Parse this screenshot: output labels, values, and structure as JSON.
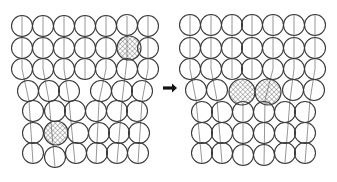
{
  "figure": {
    "colors": {
      "stroke": "#3a3a3a",
      "plane_line": "#8a8a8a",
      "hatch": "#555555",
      "background": "#ffffff"
    },
    "panels": [
      {
        "name": "before",
        "atom_radius": 10.5,
        "atoms": [
          [
            22,
            26
          ],
          [
            43,
            26
          ],
          [
            64,
            26
          ],
          [
            85,
            26
          ],
          [
            106,
            26
          ],
          [
            127,
            25
          ],
          [
            148,
            26
          ],
          [
            22,
            48
          ],
          [
            43,
            48
          ],
          [
            64,
            48
          ],
          [
            85,
            48
          ],
          [
            106,
            48
          ],
          [
            148,
            48
          ],
          [
            22,
            69
          ],
          [
            43,
            69
          ],
          [
            64,
            69
          ],
          [
            85,
            69
          ],
          [
            106,
            69
          ],
          [
            127,
            69
          ],
          [
            148,
            69
          ],
          [
            28,
            91
          ],
          [
            49,
            91
          ],
          [
            69,
            91
          ],
          [
            101,
            91
          ],
          [
            122,
            91
          ],
          [
            142,
            91
          ],
          [
            33,
            111
          ],
          [
            55,
            111
          ],
          [
            75,
            111
          ],
          [
            96,
            111
          ],
          [
            117,
            111
          ],
          [
            137,
            111
          ],
          [
            33,
            133
          ],
          [
            78,
            133
          ],
          [
            99,
            133
          ],
          [
            119,
            133
          ],
          [
            139,
            133
          ],
          [
            33,
            153
          ],
          [
            55,
            157
          ],
          [
            76,
            153
          ],
          [
            97,
            153
          ],
          [
            117,
            153
          ],
          [
            138,
            153
          ]
        ],
        "hatched_atoms": [
          [
            129,
            48,
            12
          ],
          [
            56,
            133,
            12
          ]
        ],
        "plane_lines": [
          [
            [
              22,
              16
            ],
            [
              22,
              69
            ],
            [
              29,
              101
            ],
            [
              33,
              163
            ]
          ],
          [
            [
              43,
              16
            ],
            [
              43,
              69
            ],
            [
              49,
              101
            ],
            [
              55,
              167
            ]
          ],
          [
            [
              64,
              16
            ],
            [
              64,
              69
            ],
            [
              69,
              101
            ],
            [
              75,
              163
            ]
          ],
          [
            [
              85,
              16
            ],
            [
              85,
              79
            ]
          ],
          [
            [
              106,
              16
            ],
            [
              106,
              69
            ],
            [
              99,
              101
            ],
            [
              96,
              163
            ]
          ],
          [
            [
              127,
              16
            ],
            [
              127,
              60
            ],
            [
              122,
              101
            ],
            [
              117,
              163
            ]
          ],
          [
            [
              148,
              16
            ],
            [
              148,
              69
            ],
            [
              142,
              101
            ],
            [
              138,
              163
            ]
          ]
        ]
      },
      {
        "name": "after",
        "atom_radius": 10.5,
        "atoms": [
          [
            190,
            25
          ],
          [
            211,
            25
          ],
          [
            232,
            25
          ],
          [
            252,
            25
          ],
          [
            273,
            25
          ],
          [
            294,
            25
          ],
          [
            315,
            25
          ],
          [
            190,
            48
          ],
          [
            211,
            48
          ],
          [
            232,
            48
          ],
          [
            252,
            48
          ],
          [
            273,
            48
          ],
          [
            294,
            48
          ],
          [
            315,
            48
          ],
          [
            190,
            69
          ],
          [
            211,
            69
          ],
          [
            232,
            69
          ],
          [
            252,
            69
          ],
          [
            273,
            69
          ],
          [
            294,
            69
          ],
          [
            315,
            69
          ],
          [
            196,
            90
          ],
          [
            217,
            90
          ],
          [
            293,
            90
          ],
          [
            314,
            90
          ],
          [
            202,
            112
          ],
          [
            222,
            112
          ],
          [
            243,
            112
          ],
          [
            264,
            112
          ],
          [
            285,
            112
          ],
          [
            305,
            112
          ],
          [
            202,
            133
          ],
          [
            222,
            133
          ],
          [
            243,
            133
          ],
          [
            264,
            133
          ],
          [
            285,
            133
          ],
          [
            305,
            133
          ],
          [
            202,
            153
          ],
          [
            222,
            153
          ],
          [
            243,
            155
          ],
          [
            264,
            155
          ],
          [
            285,
            153
          ],
          [
            305,
            153
          ]
        ],
        "hatched_atoms": [
          [
            242,
            92,
            13
          ],
          [
            268,
            92,
            13
          ]
        ],
        "plane_lines": [
          [
            [
              190,
              15
            ],
            [
              190,
              69
            ],
            [
              196,
              100
            ],
            [
              202,
              163
            ]
          ],
          [
            [
              211,
              15
            ],
            [
              211,
              69
            ],
            [
              217,
              100
            ],
            [
              222,
              163
            ]
          ],
          [
            [
              232,
              15
            ],
            [
              232,
              78
            ]
          ],
          [
            [
              252,
              15
            ],
            [
              252,
              79
            ]
          ],
          [
            [
              273,
              15
            ],
            [
              273,
              69
            ],
            [
              265,
              100
            ],
            [
              264,
              165
            ]
          ],
          [
            [
              294,
              15
            ],
            [
              294,
              69
            ],
            [
              290,
              100
            ],
            [
              285,
              163
            ]
          ],
          [
            [
              315,
              15
            ],
            [
              315,
              69
            ],
            [
              310,
              100
            ],
            [
              305,
              163
            ]
          ],
          [
            [
              243,
              104
            ],
            [
              243,
              165
            ]
          ]
        ]
      }
    ],
    "arrow": {
      "x1": 163,
      "x2": 177,
      "y": 88,
      "symbol": "right-arrow"
    }
  }
}
